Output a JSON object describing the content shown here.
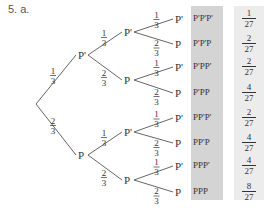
{
  "heading": "5. a.",
  "colors": {
    "outcome_shade": "#d4d4d4",
    "prob_shade": "#ececec",
    "line": "#666666"
  },
  "tree": {
    "level1": [
      {
        "label": "P'",
        "prob": {
          "num": "1",
          "den": "3"
        }
      },
      {
        "label": "P",
        "prob": {
          "num": "2",
          "den": "3"
        }
      }
    ],
    "level2": [
      {
        "label": "P'",
        "prob": {
          "num": "1",
          "den": "3"
        }
      },
      {
        "label": "P",
        "prob": {
          "num": "2",
          "den": "3"
        }
      },
      {
        "label": "P'",
        "prob": {
          "num": "1",
          "den": "3"
        }
      },
      {
        "label": "P",
        "prob": {
          "num": "2",
          "den": "3"
        }
      }
    ],
    "level3": [
      {
        "label": "P'",
        "prob": {
          "num": "1",
          "den": "3"
        }
      },
      {
        "label": "P",
        "prob": {
          "num": "2",
          "den": "3"
        }
      },
      {
        "label": "P'",
        "prob": {
          "num": "1",
          "den": "3"
        }
      },
      {
        "label": "P",
        "prob": {
          "num": "2",
          "den": "3"
        }
      },
      {
        "label": "P'",
        "prob": {
          "num": "1",
          "den": "3"
        }
      },
      {
        "label": "P",
        "prob": {
          "num": "2",
          "den": "3"
        }
      },
      {
        "label": "P'",
        "prob": {
          "num": "1",
          "den": "3"
        }
      },
      {
        "label": "P",
        "prob": {
          "num": "2",
          "den": "3"
        }
      }
    ]
  },
  "outcomes": [
    {
      "label": "P'P'P'",
      "prob": {
        "num": "1",
        "den": "27"
      }
    },
    {
      "label": "P'P'P",
      "prob": {
        "num": "2",
        "den": "27"
      }
    },
    {
      "label": "P'PP'",
      "prob": {
        "num": "2",
        "den": "27"
      }
    },
    {
      "label": "P'PP",
      "prob": {
        "num": "4",
        "den": "27"
      }
    },
    {
      "label": "PP'P'",
      "prob": {
        "num": "2",
        "den": "27"
      }
    },
    {
      "label": "PP'P",
      "prob": {
        "num": "4",
        "den": "27"
      }
    },
    {
      "label": "PPP'",
      "prob": {
        "num": "4",
        "den": "27"
      }
    },
    {
      "label": "PPP",
      "prob": {
        "num": "8",
        "den": "27"
      }
    }
  ]
}
